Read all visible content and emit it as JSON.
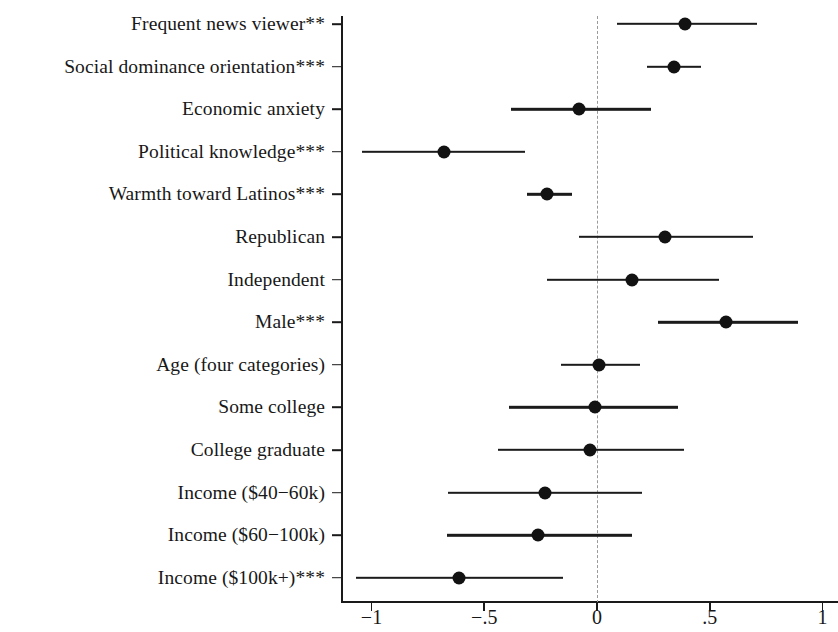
{
  "chart_data": {
    "type": "scatter",
    "subtype": "coefficient-forest-plot",
    "title": "",
    "xlabel": "",
    "ylabel": "",
    "xlim": [
      -1.15,
      1.05
    ],
    "xticks": [
      -1,
      -0.5,
      0,
      0.5,
      1
    ],
    "xtick_labels": [
      "−1",
      "−.5",
      "0",
      ".5",
      "1"
    ],
    "grid": false,
    "legend": null,
    "reference_line": {
      "value": 0,
      "style": "dashed",
      "color": "#9a9a9a"
    },
    "marker": {
      "shape": "circle",
      "color": "#121212",
      "size": 13
    },
    "error_bar": {
      "style": "solid",
      "color": "#1b1b1b",
      "width": 2.4
    },
    "categories": [
      "Frequent news viewer**",
      "Social dominance orientation***",
      "Economic anxiety",
      "Political knowledge***",
      "Warmth toward Latinos***",
      "Republican",
      "Independent",
      "Male***",
      "Age (four categories)",
      "Some college",
      "College graduate",
      "Income ($40−60k)",
      "Income ($60−100k)",
      "Income ($100k+)***"
    ],
    "points": [
      {
        "label": "Frequent news viewer**",
        "estimate": 0.39,
        "ci_low": 0.09,
        "ci_high": 0.71,
        "significance": "**"
      },
      {
        "label": "Social dominance orientation***",
        "estimate": 0.34,
        "ci_low": 0.22,
        "ci_high": 0.46,
        "significance": "***"
      },
      {
        "label": "Economic anxiety",
        "estimate": -0.08,
        "ci_low": -0.38,
        "ci_high": 0.24,
        "significance": ""
      },
      {
        "label": "Political knowledge***",
        "estimate": -0.68,
        "ci_low": -1.04,
        "ci_high": -0.32,
        "significance": "***"
      },
      {
        "label": "Warmth toward Latinos***",
        "estimate": -0.22,
        "ci_low": -0.31,
        "ci_high": -0.11,
        "significance": "***"
      },
      {
        "label": "Republican",
        "estimate": 0.3,
        "ci_low": -0.08,
        "ci_high": 0.69,
        "significance": ""
      },
      {
        "label": "Independent",
        "estimate": 0.155,
        "ci_low": -0.22,
        "ci_high": 0.54,
        "significance": ""
      },
      {
        "label": "Male***",
        "estimate": 0.57,
        "ci_low": 0.27,
        "ci_high": 0.89,
        "significance": "***"
      },
      {
        "label": "Age (four categories)",
        "estimate": 0.01,
        "ci_low": -0.16,
        "ci_high": 0.19,
        "significance": ""
      },
      {
        "label": "Some college",
        "estimate": -0.01,
        "ci_low": -0.39,
        "ci_high": 0.36,
        "significance": ""
      },
      {
        "label": "College graduate",
        "estimate": -0.03,
        "ci_low": -0.44,
        "ci_high": 0.385,
        "significance": ""
      },
      {
        "label": "Income ($40−60k)",
        "estimate": -0.23,
        "ci_low": -0.66,
        "ci_high": 0.2,
        "significance": ""
      },
      {
        "label": "Income ($60−100k)",
        "estimate": -0.26,
        "ci_low": -0.665,
        "ci_high": 0.155,
        "significance": ""
      },
      {
        "label": "Income ($100k+)***",
        "estimate": -0.61,
        "ci_low": -1.07,
        "ci_high": -0.15,
        "significance": "***"
      }
    ]
  },
  "axes": {
    "x_axis_name": "coefficient-axis",
    "y_axis_name": "category-axis"
  }
}
